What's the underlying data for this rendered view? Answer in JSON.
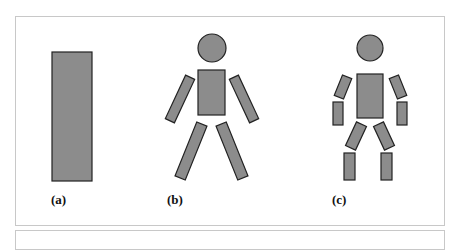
{
  "figure": {
    "panels": [
      {
        "id": "a",
        "label": "(a)",
        "description": "single bounding rectangle"
      },
      {
        "id": "b",
        "label": "(b)",
        "description": "human figure with 6 parts: head, torso, 2 arms, 2 legs"
      },
      {
        "id": "c",
        "label": "(c)",
        "description": "human figure with 10 parts: head, torso, 2 upper arms, 2 lower arms, 2 thighs, 2 shins"
      }
    ],
    "colors": {
      "fill": "#8c8c8c",
      "stroke": "#222222",
      "panel_border": "#c8c8c8"
    }
  }
}
